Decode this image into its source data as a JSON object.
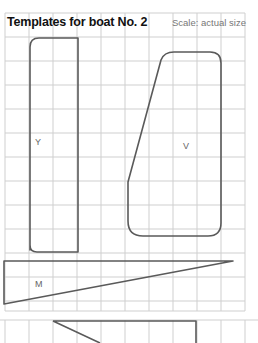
{
  "header": {
    "title": "Templates for boat No. 2",
    "scale": "Scale: actual size"
  },
  "templates": [
    {
      "label": "Y"
    },
    {
      "label": "V"
    },
    {
      "label": "M"
    }
  ],
  "colors": {
    "grid": "#c8c8c8",
    "outline": "#555555",
    "label": "#666666"
  }
}
